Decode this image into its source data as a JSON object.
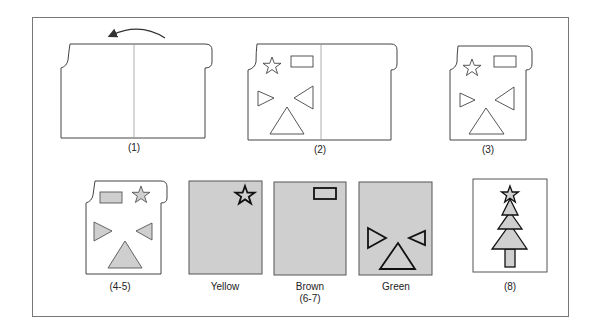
{
  "figure": {
    "colors": {
      "line": "#333333",
      "frame": "#777777",
      "fill_gray": "#cfcfcf",
      "fold_line": "#999999"
    },
    "panels": [
      {
        "id": "step-1",
        "label": "(1)"
      },
      {
        "id": "step-2",
        "label": "(2)"
      },
      {
        "id": "step-3",
        "label": "(3)"
      },
      {
        "id": "step-4-5",
        "label": "(4-5)"
      },
      {
        "id": "yellow",
        "label": "Yellow"
      },
      {
        "id": "brown",
        "label": "Brown",
        "sublabel": "(6-7)"
      },
      {
        "id": "green",
        "label": "Green"
      },
      {
        "id": "step-8",
        "label": "(8)"
      }
    ]
  }
}
